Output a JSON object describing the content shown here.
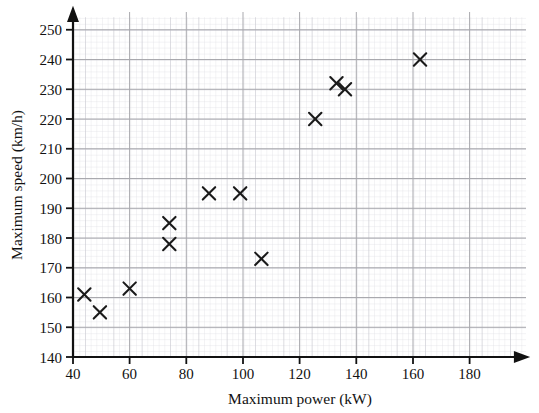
{
  "chart_data": {
    "type": "scatter",
    "title": "",
    "xlabel": "Maximum power (kW)",
    "ylabel": "Maximum speed (km/h)",
    "xlim": [
      40,
      190
    ],
    "ylim": [
      140,
      253
    ],
    "xticks": [
      40,
      60,
      80,
      100,
      120,
      140,
      160,
      180
    ],
    "yticks": [
      140,
      150,
      160,
      170,
      180,
      190,
      200,
      210,
      220,
      230,
      240,
      250
    ],
    "grid": true,
    "grid_minor": true,
    "legend": "none",
    "marker": "x",
    "marker_color": "#1a1a1a",
    "points": [
      {
        "x": 44,
        "y": 161
      },
      {
        "x": 49.5,
        "y": 155
      },
      {
        "x": 60,
        "y": 163
      },
      {
        "x": 74,
        "y": 185
      },
      {
        "x": 74,
        "y": 178
      },
      {
        "x": 88,
        "y": 195
      },
      {
        "x": 99,
        "y": 195
      },
      {
        "x": 106.5,
        "y": 173
      },
      {
        "x": 125.5,
        "y": 220
      },
      {
        "x": 133,
        "y": 232
      },
      {
        "x": 136,
        "y": 230
      },
      {
        "x": 162.5,
        "y": 240
      }
    ]
  },
  "axes": {
    "x_tick_labels": [
      "40",
      "60",
      "80",
      "100",
      "120",
      "140",
      "160",
      "180"
    ],
    "y_tick_labels": [
      "140",
      "150",
      "160",
      "170",
      "180",
      "190",
      "200",
      "210",
      "220",
      "230",
      "240",
      "250"
    ],
    "x_axis_title": "Maximum power (kW)",
    "y_axis_title": "Maximum speed (km/h)"
  },
  "colors": {
    "axis": "#111111",
    "marker": "#1a1a1a",
    "grid_major": "#a9a9ae",
    "grid_minor": "#dcdce2",
    "background": "#ffffff"
  }
}
